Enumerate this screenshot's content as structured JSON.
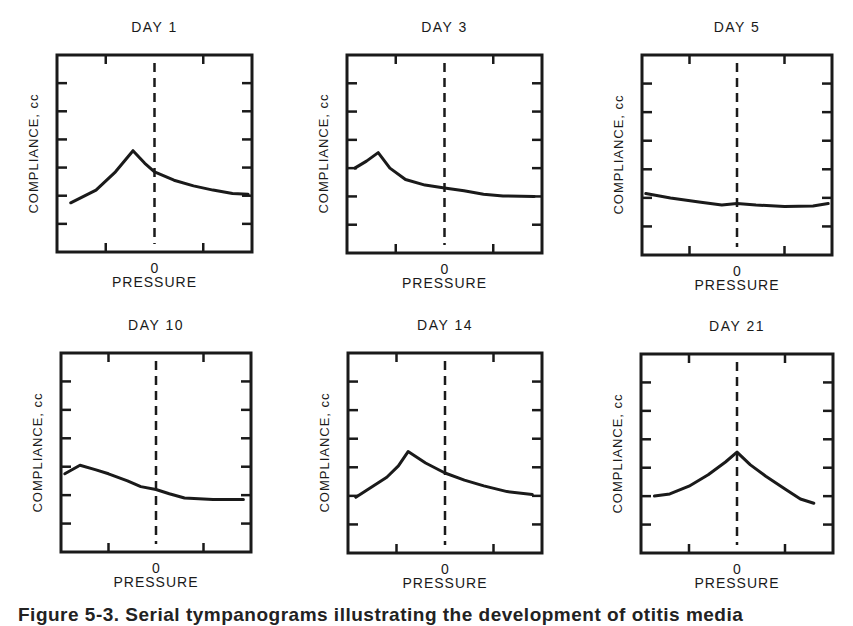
{
  "figure": {
    "caption": "Figure 5-3.  Serial tympanograms illustrating the development of otitis media"
  },
  "colors": {
    "ink": "#1a1a1a",
    "background": "#ffffff"
  },
  "chart_data": [
    {
      "type": "line",
      "title": "DAY 1",
      "xlabel": "PRESSURE",
      "ylabel": "COMPLIANCE, cc",
      "x_tick_labels": [
        "0"
      ],
      "xlim": [
        0,
        1
      ],
      "ylim": [
        0,
        7
      ],
      "zero_line_x": 0.5,
      "grid": false,
      "x": [
        0.07,
        0.2,
        0.3,
        0.39,
        0.45,
        0.5,
        0.6,
        0.7,
        0.8,
        0.9,
        0.98
      ],
      "values": [
        1.75,
        2.2,
        2.85,
        3.6,
        3.15,
        2.85,
        2.55,
        2.35,
        2.2,
        2.08,
        2.05
      ]
    },
    {
      "type": "line",
      "title": "DAY 3",
      "xlabel": "PRESSURE",
      "ylabel": "COMPLIANCE, cc",
      "x_tick_labels": [
        "0"
      ],
      "xlim": [
        0,
        1
      ],
      "ylim": [
        0,
        7
      ],
      "zero_line_x": 0.5,
      "grid": false,
      "x": [
        0.04,
        0.1,
        0.16,
        0.22,
        0.3,
        0.4,
        0.5,
        0.6,
        0.7,
        0.8,
        0.96
      ],
      "values": [
        3.0,
        3.25,
        3.55,
        3.0,
        2.6,
        2.4,
        2.3,
        2.2,
        2.08,
        2.02,
        2.0
      ]
    },
    {
      "type": "line",
      "title": "DAY 5",
      "xlabel": "PRESSURE",
      "ylabel": "COMPLIANCE, cc",
      "x_tick_labels": [
        "0"
      ],
      "xlim": [
        0,
        1
      ],
      "ylim": [
        0,
        7
      ],
      "zero_line_x": 0.5,
      "grid": false,
      "x": [
        0.02,
        0.15,
        0.3,
        0.42,
        0.5,
        0.6,
        0.75,
        0.9,
        0.98
      ],
      "values": [
        2.15,
        2.0,
        1.85,
        1.75,
        1.8,
        1.75,
        1.7,
        1.72,
        1.8
      ]
    },
    {
      "type": "line",
      "title": "DAY 10",
      "xlabel": "PRESSURE",
      "ylabel": "COMPLIANCE, cc",
      "x_tick_labels": [
        "0"
      ],
      "xlim": [
        0,
        1
      ],
      "ylim": [
        0,
        7
      ],
      "zero_line_x": 0.5,
      "grid": false,
      "x": [
        0.02,
        0.1,
        0.18,
        0.25,
        0.35,
        0.42,
        0.5,
        0.57,
        0.65,
        0.8,
        0.96
      ],
      "values": [
        2.75,
        3.05,
        2.9,
        2.75,
        2.5,
        2.3,
        2.2,
        2.05,
        1.9,
        1.85,
        1.85
      ]
    },
    {
      "type": "line",
      "title": "DAY 14",
      "xlabel": "PRESSURE",
      "ylabel": "COMPLIANCE, cc",
      "x_tick_labels": [
        "0"
      ],
      "xlim": [
        0,
        1
      ],
      "ylim": [
        0,
        7
      ],
      "zero_line_x": 0.5,
      "grid": false,
      "x": [
        0.04,
        0.12,
        0.2,
        0.26,
        0.31,
        0.4,
        0.5,
        0.6,
        0.7,
        0.82,
        0.95
      ],
      "values": [
        1.95,
        2.3,
        2.65,
        3.05,
        3.55,
        3.15,
        2.8,
        2.55,
        2.35,
        2.15,
        2.05
      ]
    },
    {
      "type": "line",
      "title": "DAY 21",
      "xlabel": "PRESSURE",
      "ylabel": "COMPLIANCE, cc",
      "x_tick_labels": [
        "0"
      ],
      "xlim": [
        0,
        1
      ],
      "ylim": [
        0,
        7
      ],
      "zero_line_x": 0.5,
      "grid": false,
      "x": [
        0.07,
        0.15,
        0.25,
        0.35,
        0.44,
        0.5,
        0.57,
        0.65,
        0.75,
        0.83,
        0.9
      ],
      "values": [
        2.0,
        2.08,
        2.35,
        2.75,
        3.2,
        3.55,
        3.1,
        2.7,
        2.25,
        1.9,
        1.75
      ]
    }
  ],
  "layout": {
    "panels": [
      {
        "box": [
          57,
          55,
          195,
          197
        ]
      },
      {
        "box": [
          347,
          55,
          195,
          198
        ]
      },
      {
        "box": [
          642,
          55,
          190,
          200
        ]
      },
      {
        "box": [
          61,
          353,
          190,
          199
        ]
      },
      {
        "box": [
          348,
          353,
          194,
          200
        ]
      },
      {
        "box": [
          641,
          354,
          192,
          199
        ]
      }
    ]
  }
}
